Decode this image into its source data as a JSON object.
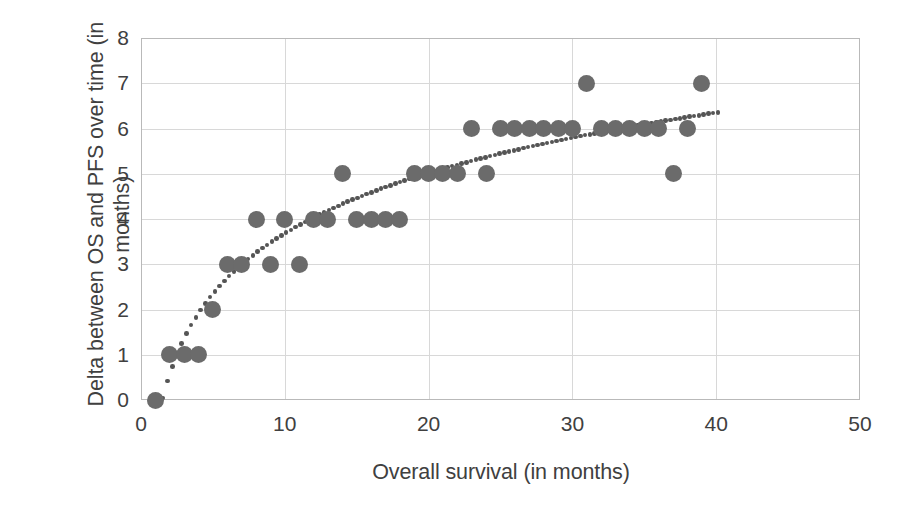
{
  "chart_data": {
    "type": "scatter",
    "title": "",
    "xlabel": "Overall survival (in months)",
    "ylabel": "Delta between OS and PFS over time (in months)",
    "xlim": [
      0,
      50
    ],
    "ylim": [
      0,
      8
    ],
    "xticks": [
      0,
      10,
      20,
      30,
      40,
      50
    ],
    "yticks": [
      0,
      1,
      2,
      3,
      4,
      5,
      6,
      7,
      8
    ],
    "grid": true,
    "legend": "none",
    "marker_color": "#6b6b6b",
    "trendline": {
      "style": "dotted",
      "color": "#555555",
      "label": "logarithmic trend"
    },
    "series": [
      {
        "name": "Delta between OS and PFS",
        "points": [
          [
            1,
            0
          ],
          [
            2,
            1
          ],
          [
            3,
            1
          ],
          [
            4,
            1
          ],
          [
            5,
            2
          ],
          [
            6,
            3
          ],
          [
            7,
            3
          ],
          [
            9,
            3
          ],
          [
            11,
            3
          ],
          [
            8,
            4
          ],
          [
            10,
            4
          ],
          [
            12,
            4
          ],
          [
            13,
            4
          ],
          [
            15,
            4
          ],
          [
            16,
            4
          ],
          [
            17,
            4
          ],
          [
            18,
            4
          ],
          [
            14,
            5
          ],
          [
            19,
            5
          ],
          [
            20,
            5
          ],
          [
            21,
            5
          ],
          [
            22,
            5
          ],
          [
            24,
            5
          ],
          [
            37,
            5
          ],
          [
            23,
            6
          ],
          [
            25,
            6
          ],
          [
            26,
            6
          ],
          [
            27,
            6
          ],
          [
            28,
            6
          ],
          [
            29,
            6
          ],
          [
            30,
            6
          ],
          [
            32,
            6
          ],
          [
            33,
            6
          ],
          [
            34,
            6
          ],
          [
            35,
            6
          ],
          [
            36,
            6
          ],
          [
            38,
            6
          ],
          [
            31,
            7
          ],
          [
            39,
            7
          ]
        ]
      }
    ]
  },
  "axes": {
    "xtick_labels": [
      "0",
      "10",
      "20",
      "30",
      "40",
      "50"
    ],
    "ytick_labels": [
      "0",
      "1",
      "2",
      "3",
      "4",
      "5",
      "6",
      "7",
      "8"
    ]
  }
}
